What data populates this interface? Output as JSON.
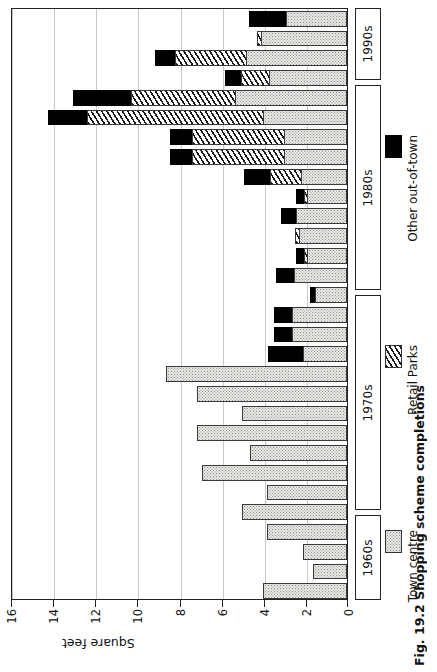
{
  "caption": "Fig. 19.2  Shopping scheme completions",
  "axis": {
    "value_axis_title": "Square feet",
    "ticks": [
      0,
      2,
      4,
      6,
      8,
      10,
      12,
      14,
      16
    ],
    "tick_labels": [
      "0",
      "2",
      "4",
      "6",
      "8",
      "10",
      "12",
      "14",
      "16"
    ]
  },
  "legend": {
    "items": [
      {
        "label": "Town centre",
        "key": "town",
        "color": "#eceae6",
        "pattern": "dotted"
      },
      {
        "label": "Retail Parks",
        "key": "retail",
        "color": "#ffffff",
        "pattern": "hatched"
      },
      {
        "label": "Other out-of-town",
        "key": "other",
        "color": "#000000",
        "pattern": "solid"
      }
    ]
  },
  "decades": [
    {
      "label": "1990s",
      "top": 8,
      "height": 72
    },
    {
      "label": "1980s",
      "top": 85,
      "height": 205
    },
    {
      "label": "1970s",
      "top": 295,
      "height": 215
    },
    {
      "label": "1960s",
      "top": 515,
      "height": 85
    }
  ],
  "chart_data": {
    "type": "bar",
    "orientation": "horizontal-rotated",
    "title": "Fig. 19.2  Shopping scheme completions",
    "xlabel": "Square feet",
    "ylabel": "",
    "xlim": [
      0,
      16
    ],
    "grid": true,
    "stacked": true,
    "legend_position": "right",
    "series": [
      {
        "name": "Town centre",
        "key": "town"
      },
      {
        "name": "Retail Parks",
        "key": "retail"
      },
      {
        "name": "Other out-of-town",
        "key": "other"
      }
    ],
    "categories": [
      "1990s-a",
      "1990s-b",
      "1990s-c",
      "1980s-a",
      "1980s-b",
      "1980s-c",
      "1980s-d",
      "1980s-e",
      "1980s-f",
      "1980s-g",
      "1980s-h",
      "1980s-i",
      "1980s-j",
      "1970s-a",
      "1970s-b",
      "1970s-c",
      "1970s-d",
      "1970s-e",
      "1970s-f",
      "1970s-g",
      "1970s-h",
      "1970s-i",
      "1970s-j",
      "1960s-a",
      "1960s-b",
      "1960s-c",
      "1960s-d"
    ],
    "rows": [
      {
        "decade": "1990s",
        "town": 2.9,
        "retail": 0.0,
        "other": 1.8
      },
      {
        "decade": "1990s",
        "town": 4.1,
        "retail": 0.2,
        "other": 0.0
      },
      {
        "decade": "1990s",
        "town": 4.8,
        "retail": 3.4,
        "other": 1.0
      },
      {
        "decade": "1980s",
        "town": 3.7,
        "retail": 1.4,
        "other": 0.8
      },
      {
        "decade": "1980s",
        "town": 5.3,
        "retail": 5.0,
        "other": 2.8
      },
      {
        "decade": "1980s",
        "town": 4.0,
        "retail": 8.4,
        "other": 1.9
      },
      {
        "decade": "1980s",
        "town": 3.0,
        "retail": 4.4,
        "other": 1.1
      },
      {
        "decade": "1980s",
        "town": 3.0,
        "retail": 4.4,
        "other": 1.1
      },
      {
        "decade": "1980s",
        "town": 2.2,
        "retail": 1.5,
        "other": 1.3
      },
      {
        "decade": "1980s",
        "town": 1.9,
        "retail": 0.2,
        "other": 0.4
      },
      {
        "decade": "1980s",
        "town": 2.4,
        "retail": 0.0,
        "other": 0.8
      },
      {
        "decade": "1980s",
        "town": 2.3,
        "retail": 0.2,
        "other": 0.0
      },
      {
        "decade": "1980s",
        "town": 1.9,
        "retail": 0.2,
        "other": 0.4
      },
      {
        "decade": "1970s",
        "town": 2.5,
        "retail": 0.0,
        "other": 0.9
      },
      {
        "decade": "1970s",
        "town": 1.5,
        "retail": 0.0,
        "other": 0.3
      },
      {
        "decade": "1970s",
        "town": 2.6,
        "retail": 0.0,
        "other": 0.9
      },
      {
        "decade": "1970s",
        "town": 2.6,
        "retail": 0.0,
        "other": 0.9
      },
      {
        "decade": "1970s",
        "town": 2.1,
        "retail": 0.0,
        "other": 1.7
      },
      {
        "decade": "1970s",
        "town": 8.6,
        "retail": 0.0,
        "other": 0.0
      },
      {
        "decade": "1970s",
        "town": 7.1,
        "retail": 0.0,
        "other": 0.0
      },
      {
        "decade": "1970s",
        "town": 5.0,
        "retail": 0.0,
        "other": 0.0
      },
      {
        "decade": "1970s",
        "town": 7.1,
        "retail": 0.0,
        "other": 0.0
      },
      {
        "decade": "1970s",
        "town": 4.6,
        "retail": 0.0,
        "other": 0.0
      },
      {
        "decade": "1970s",
        "town": 6.9,
        "retail": 0.0,
        "other": 0.0
      },
      {
        "decade": "1960s",
        "town": 3.8,
        "retail": 0.0,
        "other": 0.0
      },
      {
        "decade": "1960s",
        "town": 5.0,
        "retail": 0.0,
        "other": 0.0
      },
      {
        "decade": "1960s",
        "town": 3.8,
        "retail": 0.0,
        "other": 0.0
      },
      {
        "decade": "1960s",
        "town": 2.1,
        "retail": 0.0,
        "other": 0.0
      },
      {
        "decade": "1960s",
        "town": 1.6,
        "retail": 0.0,
        "other": 0.0
      },
      {
        "decade": "1960s",
        "town": 4.0,
        "retail": 0.0,
        "other": 0.0
      }
    ]
  }
}
